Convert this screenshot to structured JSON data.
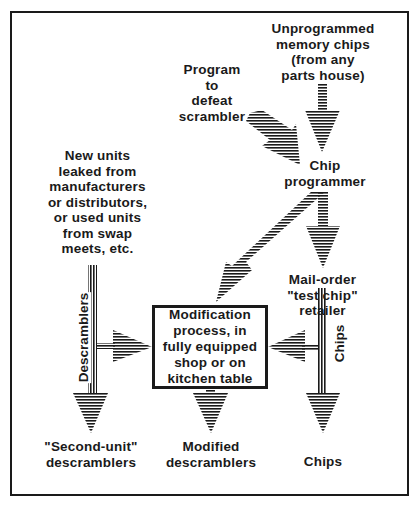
{
  "diagram": {
    "nodes": {
      "unprogrammed_chips": "Unprogrammed\nmemory chips\n(from any\nparts house)",
      "program": "Program\nto\ndefeat\nscrambler",
      "chip_programmer": "Chip\nprogrammer",
      "new_units": "New units\nleaked from\nmanufacturers\nor distributors,\nor used units\nfrom swap\nmeets, etc.",
      "mail_order": "Mail-order\n\"test chip\"\nretailer",
      "modification": "Modification\nprocess, in\nfully equipped\nshop or on\nkitchen table",
      "second_unit": "\"Second-unit\"\ndescramblers",
      "modified": "Modified\ndescramblers",
      "chips_out": "Chips"
    },
    "edge_labels": {
      "descramblers": "Descramblers",
      "chips": "Chips"
    },
    "edges": [
      {
        "from": "unprogrammed_chips",
        "to": "chip_programmer"
      },
      {
        "from": "program",
        "to": "chip_programmer"
      },
      {
        "from": "chip_programmer",
        "to": "modification"
      },
      {
        "from": "chip_programmer",
        "to": "mail_order"
      },
      {
        "from": "new_units",
        "to": "modification",
        "label": "Descramblers"
      },
      {
        "from": "new_units",
        "to": "second_unit",
        "label": "Descramblers"
      },
      {
        "from": "mail_order",
        "to": "modification",
        "label": "Chips"
      },
      {
        "from": "mail_order",
        "to": "chips_out",
        "label": "Chips"
      },
      {
        "from": "modification",
        "to": "modified"
      }
    ],
    "colors": {
      "ink": "#1a1a1a",
      "background": "#ffffff"
    }
  }
}
